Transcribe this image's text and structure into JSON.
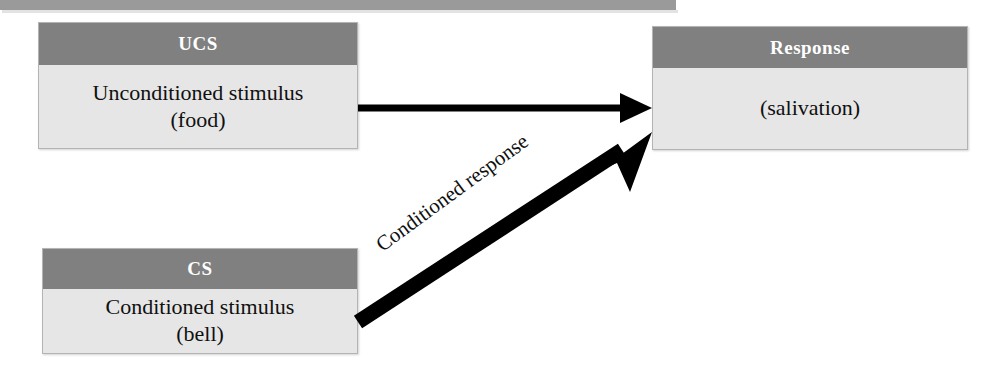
{
  "diagram": {
    "colors": {
      "header_gray": "#808080",
      "body_fill": "#e6e6e6",
      "box_border": "#b4b4b4",
      "top_bar": "#9a9a9a",
      "arrow_black": "#000000",
      "header_text": "#ffffff",
      "body_text": "#101010"
    },
    "nodes": [
      {
        "id": "ucs",
        "header": "UCS",
        "body_lines": [
          "Unconditioned stimulus",
          "(food)"
        ]
      },
      {
        "id": "cs",
        "header": "CS",
        "body_lines": [
          "Conditioned stimulus",
          "(bell)"
        ]
      },
      {
        "id": "response",
        "header": "Response",
        "body_lines": [
          "(salivation)"
        ]
      }
    ],
    "edges": [
      {
        "id": "ucs-to-response",
        "from": "ucs",
        "to": "response",
        "label": "",
        "style": "thin-straight"
      },
      {
        "id": "cs-to-response",
        "from": "cs",
        "to": "response",
        "label": "Conditioned response",
        "style": "thick-diagonal"
      }
    ]
  }
}
